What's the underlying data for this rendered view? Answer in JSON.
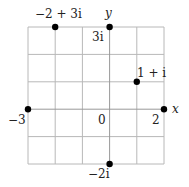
{
  "diagram": {
    "axes": {
      "x_label": "x",
      "y_label": "y",
      "x_range": [
        -3,
        2
      ],
      "y_range": [
        -2,
        3
      ],
      "grid": true
    },
    "tick_labels": {
      "origin": "0",
      "x_min": "−3",
      "x_max": "2",
      "y_max": "3i",
      "y_min": "−2i"
    },
    "points": [
      {
        "label": "−2 + 3i",
        "re": -2,
        "im": 3
      },
      {
        "label": "3i",
        "re": 0,
        "im": 3
      },
      {
        "label": "1 + i",
        "re": 1,
        "im": 1
      },
      {
        "label": "−3",
        "re": -3,
        "im": 0
      },
      {
        "label": "2",
        "re": 2,
        "im": 0
      },
      {
        "label": "−2i",
        "re": 0,
        "im": -2
      }
    ],
    "colors": {
      "grid": "#b8b8b8",
      "point": "#000000",
      "text": "#222222"
    }
  }
}
